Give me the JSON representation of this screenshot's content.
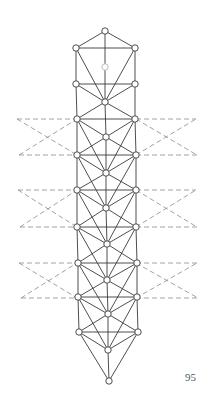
{
  "diagram": {
    "title": "",
    "page_number": "95",
    "colors": {
      "stroke": "#3a3a3a",
      "dashed": "#8a8a8a",
      "node_fill": "#ffffff",
      "node_stroke": "#3a3a3a",
      "faint_node_stroke": "#b5b5b5"
    },
    "nodes": [
      {
        "id": "top",
        "x": 105,
        "y": 31
      },
      {
        "id": "L1",
        "x": 76,
        "y": 48
      },
      {
        "id": "R1",
        "x": 135,
        "y": 48
      },
      {
        "id": "C1",
        "x": 105,
        "y": 67,
        "faint": true
      },
      {
        "id": "L2",
        "x": 76,
        "y": 84
      },
      {
        "id": "R2",
        "x": 135,
        "y": 84
      },
      {
        "id": "C2",
        "x": 105,
        "y": 102
      },
      {
        "id": "L3",
        "x": 77,
        "y": 119
      },
      {
        "id": "R3",
        "x": 135,
        "y": 119
      },
      {
        "id": "C3",
        "x": 106,
        "y": 137
      },
      {
        "id": "L4",
        "x": 77,
        "y": 155
      },
      {
        "id": "R4",
        "x": 136,
        "y": 155
      },
      {
        "id": "C4",
        "x": 106,
        "y": 173
      },
      {
        "id": "L5",
        "x": 77,
        "y": 190
      },
      {
        "id": "R5",
        "x": 136,
        "y": 190
      },
      {
        "id": "C5",
        "x": 106,
        "y": 208
      },
      {
        "id": "L6",
        "x": 77,
        "y": 227
      },
      {
        "id": "R6",
        "x": 136,
        "y": 227
      },
      {
        "id": "C6",
        "x": 107,
        "y": 244
      },
      {
        "id": "L7",
        "x": 78,
        "y": 263
      },
      {
        "id": "R7",
        "x": 137,
        "y": 263
      },
      {
        "id": "C7",
        "x": 107,
        "y": 280
      },
      {
        "id": "L8",
        "x": 78,
        "y": 297
      },
      {
        "id": "R8",
        "x": 137,
        "y": 297
      },
      {
        "id": "C8",
        "x": 108,
        "y": 314
      },
      {
        "id": "L9",
        "x": 79,
        "y": 332
      },
      {
        "id": "R9",
        "x": 138,
        "y": 332
      },
      {
        "id": "C9",
        "x": 108,
        "y": 350
      },
      {
        "id": "bottom",
        "x": 109,
        "y": 381
      }
    ],
    "edges": [
      [
        "top",
        "L1"
      ],
      [
        "top",
        "R1"
      ],
      [
        "top",
        "C1"
      ],
      [
        "L1",
        "R1"
      ],
      [
        "L1",
        "L2"
      ],
      [
        "R1",
        "R2"
      ],
      [
        "L1",
        "C2"
      ],
      [
        "R1",
        "C2"
      ],
      [
        "C1",
        "C2"
      ],
      [
        "L2",
        "R2"
      ],
      [
        "L2",
        "C2"
      ],
      [
        "R2",
        "C2"
      ],
      [
        "L2",
        "L3"
      ],
      [
        "R2",
        "R3"
      ],
      [
        "C2",
        "L3"
      ],
      [
        "C2",
        "R3"
      ],
      [
        "C2",
        "C3"
      ],
      [
        "L3",
        "R3"
      ],
      [
        "L3",
        "C3"
      ],
      [
        "R3",
        "C3"
      ],
      [
        "L3",
        "C4"
      ],
      [
        "R3",
        "C4"
      ],
      [
        "L3",
        "L4"
      ],
      [
        "R3",
        "R4"
      ],
      [
        "C3",
        "C4"
      ],
      [
        "L4",
        "R4"
      ],
      [
        "L4",
        "C3"
      ],
      [
        "R4",
        "C3"
      ],
      [
        "L4",
        "C4"
      ],
      [
        "R4",
        "C4"
      ],
      [
        "L4",
        "L5"
      ],
      [
        "R4",
        "R5"
      ],
      [
        "C4",
        "C5"
      ],
      [
        "L5",
        "R5"
      ],
      [
        "L5",
        "C4"
      ],
      [
        "R5",
        "C4"
      ],
      [
        "L5",
        "C5"
      ],
      [
        "R5",
        "C5"
      ],
      [
        "L4",
        "C5"
      ],
      [
        "R4",
        "C5"
      ],
      [
        "L5",
        "L6"
      ],
      [
        "R5",
        "R6"
      ],
      [
        "C5",
        "C6"
      ],
      [
        "L6",
        "R6"
      ],
      [
        "L6",
        "C5"
      ],
      [
        "R6",
        "C5"
      ],
      [
        "L6",
        "C6"
      ],
      [
        "R6",
        "C6"
      ],
      [
        "L5",
        "C6"
      ],
      [
        "R5",
        "C6"
      ],
      [
        "L6",
        "L7"
      ],
      [
        "R6",
        "R7"
      ],
      [
        "C6",
        "C7"
      ],
      [
        "L7",
        "R7"
      ],
      [
        "L7",
        "C6"
      ],
      [
        "R7",
        "C6"
      ],
      [
        "L7",
        "C7"
      ],
      [
        "R7",
        "C7"
      ],
      [
        "L6",
        "C7"
      ],
      [
        "R6",
        "C7"
      ],
      [
        "L7",
        "L8"
      ],
      [
        "R7",
        "R8"
      ],
      [
        "C7",
        "C8"
      ],
      [
        "L8",
        "R8"
      ],
      [
        "L8",
        "C7"
      ],
      [
        "R8",
        "C7"
      ],
      [
        "L8",
        "C8"
      ],
      [
        "R8",
        "C8"
      ],
      [
        "L7",
        "C8"
      ],
      [
        "R7",
        "C8"
      ],
      [
        "L8",
        "L9"
      ],
      [
        "R8",
        "R9"
      ],
      [
        "C8",
        "C9"
      ],
      [
        "L9",
        "R9"
      ],
      [
        "L9",
        "C8"
      ],
      [
        "R9",
        "C8"
      ],
      [
        "L9",
        "C9"
      ],
      [
        "R9",
        "C9"
      ],
      [
        "L8",
        "C9"
      ],
      [
        "R8",
        "C9"
      ],
      [
        "L9",
        "bottom"
      ],
      [
        "R9",
        "bottom"
      ],
      [
        "C9",
        "bottom"
      ]
    ],
    "dashed_bands": [
      {
        "top_y": 119,
        "bottom_y": 155,
        "left_x": 17,
        "right_x": 197
      },
      {
        "top_y": 190,
        "bottom_y": 227,
        "left_x": 18,
        "right_x": 197
      },
      {
        "top_y": 263,
        "bottom_y": 298,
        "left_x": 19,
        "right_x": 198
      }
    ]
  }
}
